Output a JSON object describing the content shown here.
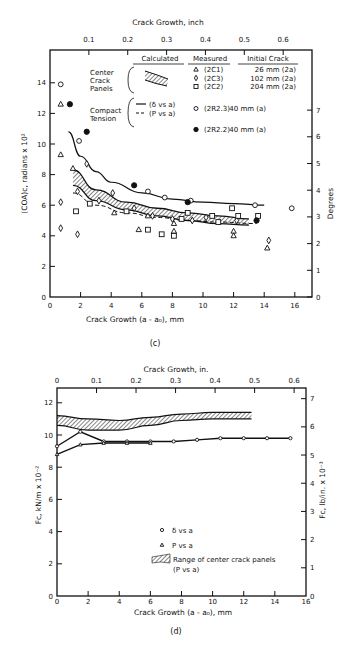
{
  "chart_data": [
    {
      "id": "c",
      "type": "scatter",
      "caption": "(c)",
      "title": "",
      "xlabel": "Crack Growth (a - a0), mm",
      "x2label": "Crack Growth, inch",
      "ylabel": "(COA)c, radians x 10^2",
      "y2label": "Degrees",
      "xlim": [
        0,
        17
      ],
      "ylim": [
        0,
        16
      ],
      "xticks": [
        0,
        2,
        4,
        6,
        8,
        10,
        12,
        14,
        16
      ],
      "yticks": [
        0,
        2,
        4,
        6,
        8,
        10,
        12,
        14
      ],
      "x2ticks": [
        "0.1",
        "0.2",
        "0.3",
        "0.4",
        "0.5",
        "0.6"
      ],
      "y2ticks": [
        "0",
        "1",
        "2",
        "3",
        "4",
        "5",
        "6",
        "7"
      ],
      "grid": false,
      "legend": {
        "headers": {
          "calculated": "Calculated",
          "measured": "Measured",
          "initial_crack": "Initial Crack"
        },
        "groups": [
          {
            "label": "Center Crack Panels",
            "calc": "hatched band",
            "rows": [
              {
                "marker": "triangle",
                "spec": "(2C1)",
                "crack": "26 mm (2a)"
              },
              {
                "marker": "diamond",
                "spec": "(2C3)",
                "crack": "102 mm (2a)"
              },
              {
                "marker": "square",
                "spec": "(2C2)",
                "crack": "204 mm (2a)"
              }
            ]
          },
          {
            "label": "Compact Tension",
            "calc_lines": [
              {
                "style": "solid",
                "text": "(δ vs a)"
              },
              {
                "style": "dashed",
                "text": "(P vs a)"
              }
            ],
            "rows": [
              {
                "marker": "circle-open",
                "spec": "(2R2.3)",
                "crack": "40 mm (a)"
              },
              {
                "marker": "circle-filled",
                "spec": "(2R2.2)",
                "crack": "40 mm (a)"
              }
            ]
          }
        ]
      },
      "series": [
        {
          "name": "2C1",
          "marker": "triangle",
          "points": [
            [
              0.7,
              12.6
            ],
            [
              0.7,
              9.3
            ],
            [
              1.5,
              8.4
            ],
            [
              4.2,
              5.5
            ],
            [
              5.8,
              4.4
            ],
            [
              6.4,
              5.3
            ],
            [
              8.1,
              4.8
            ],
            [
              8.1,
              4.3
            ],
            [
              12.0,
              4.3
            ],
            [
              12.0,
              4.0
            ],
            [
              14.2,
              3.2
            ]
          ]
        },
        {
          "name": "2C3",
          "marker": "diamond",
          "points": [
            [
              0.7,
              6.2
            ],
            [
              0.7,
              4.5
            ],
            [
              1.8,
              6.9
            ],
            [
              1.8,
              4.1
            ],
            [
              2.4,
              8.7
            ],
            [
              3.2,
              6.3
            ],
            [
              4.1,
              6.8
            ],
            [
              5.5,
              5.8
            ],
            [
              6.7,
              5.3
            ],
            [
              8.0,
              5.1
            ],
            [
              9.3,
              5.0
            ],
            [
              10.2,
              5.2
            ],
            [
              12.2,
              5.0
            ],
            [
              14.3,
              3.7
            ]
          ]
        },
        {
          "name": "2C2",
          "marker": "square",
          "points": [
            [
              1.7,
              5.6
            ],
            [
              2.6,
              6.1
            ],
            [
              5.0,
              5.6
            ],
            [
              6.4,
              4.4
            ],
            [
              7.3,
              4.1
            ],
            [
              8.1,
              4.0
            ],
            [
              8.6,
              5.1
            ],
            [
              9.0,
              5.5
            ],
            [
              10.6,
              5.3
            ],
            [
              11.0,
              4.9
            ],
            [
              11.9,
              5.8
            ],
            [
              12.3,
              5.3
            ],
            [
              13.6,
              5.3
            ]
          ]
        },
        {
          "name": "2R2.3",
          "marker": "circle-open",
          "points": [
            [
              0.7,
              13.9
            ],
            [
              1.9,
              10.2
            ],
            [
              6.4,
              6.9
            ],
            [
              7.5,
              6.5
            ],
            [
              9.2,
              6.3
            ],
            [
              13.4,
              6.0
            ],
            [
              15.8,
              5.8
            ]
          ]
        },
        {
          "name": "2R2.2",
          "marker": "circle-filled",
          "points": [
            [
              1.3,
              12.6
            ],
            [
              2.4,
              10.8
            ],
            [
              5.5,
              7.3
            ],
            [
              9.0,
              6.2
            ],
            [
              13.5,
              5.0
            ]
          ]
        }
      ],
      "curves": [
        {
          "name": "δ vs a (2R2.3)",
          "style": "solid",
          "x": [
            1.2,
            2,
            3,
            4,
            6,
            8,
            10,
            12,
            14
          ],
          "y": [
            10.8,
            9.2,
            8.2,
            7.5,
            6.8,
            6.4,
            6.2,
            6.1,
            6.0
          ]
        },
        {
          "name": "P vs a (2R2.2)",
          "style": "dashed",
          "x": [
            1.5,
            3,
            5,
            7,
            9,
            11,
            13.5
          ],
          "y": [
            6.8,
            6.0,
            5.5,
            5.2,
            5.0,
            4.9,
            4.8
          ]
        },
        {
          "name": "Center crack band upper",
          "style": "solid",
          "x": [
            1.5,
            3,
            5,
            7,
            9,
            11,
            13
          ],
          "y": [
            8.3,
            7.0,
            6.2,
            5.8,
            5.5,
            5.3,
            5.1
          ]
        },
        {
          "name": "Center crack band lower",
          "style": "solid",
          "x": [
            1.5,
            3,
            5,
            7,
            9,
            11,
            13
          ],
          "y": [
            7.3,
            6.3,
            5.7,
            5.3,
            5.0,
            4.8,
            4.7
          ]
        }
      ]
    },
    {
      "id": "d",
      "type": "line",
      "caption": "(d)",
      "title": "",
      "xlabel": "Crack Growth (a - a0), mm",
      "x2label": "Crack Growth, in.",
      "ylabel": "Fc, kN/m x 10^-2",
      "y2label": "Fc, lb/in. x 10^-3",
      "xlim": [
        0,
        16
      ],
      "ylim": [
        0,
        13
      ],
      "xticks": [
        0,
        2,
        4,
        6,
        8,
        10,
        12,
        14,
        16
      ],
      "yticks": [
        0,
        2,
        4,
        6,
        8,
        10,
        12
      ],
      "x2ticks": [
        "0",
        "0.1",
        "0.2",
        "0.3",
        "0.4",
        "0.5",
        "0.6"
      ],
      "y2ticks": [
        "0",
        "1",
        "2",
        "3",
        "4",
        "5",
        "6",
        "7"
      ],
      "grid": false,
      "legend": [
        {
          "marker": "circle-open",
          "text": "δ vs a"
        },
        {
          "marker": "triangle",
          "text": "P vs a"
        },
        {
          "marker": "hatched",
          "text": "Range of center crack panels (P vs a)"
        }
      ],
      "series": [
        {
          "name": "δ vs a",
          "marker": "circle-open",
          "x": [
            0,
            1.5,
            3,
            4.5,
            6,
            7.5,
            9,
            10.5,
            12,
            13.5,
            15
          ],
          "y": [
            9.3,
            10.2,
            9.6,
            9.6,
            9.6,
            9.6,
            9.7,
            9.8,
            9.8,
            9.8,
            9.8
          ]
        },
        {
          "name": "P vs a",
          "marker": "triangle",
          "x": [
            0,
            1.5,
            3,
            4.5,
            6
          ],
          "y": [
            8.8,
            9.4,
            9.5,
            9.5,
            9.5
          ]
        },
        {
          "name": "Range of center crack panels upper",
          "x": [
            0,
            2,
            4,
            6,
            8,
            10,
            12.5
          ],
          "y": [
            11.2,
            11.0,
            10.9,
            11.1,
            11.3,
            11.4,
            11.4
          ]
        },
        {
          "name": "Range of center crack panels lower",
          "x": [
            0,
            2,
            4,
            6,
            8,
            10,
            12.5
          ],
          "y": [
            10.6,
            10.3,
            10.3,
            10.6,
            10.9,
            11.0,
            11.0
          ]
        }
      ]
    }
  ]
}
